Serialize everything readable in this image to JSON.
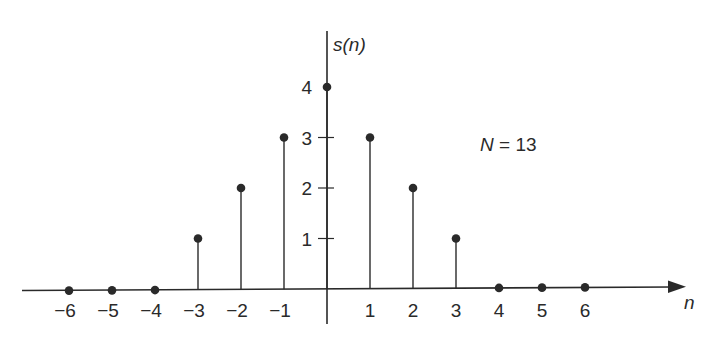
{
  "chart_data": {
    "type": "stem",
    "title": "",
    "xlabel": "n",
    "ylabel": "s(n)",
    "x": [
      -6,
      -5,
      -4,
      -3,
      -2,
      -1,
      0,
      1,
      2,
      3,
      4,
      5,
      6
    ],
    "values": [
      0,
      0,
      0,
      1,
      2,
      3,
      4,
      3,
      2,
      1,
      0,
      0,
      0
    ],
    "x_tick_labels": [
      "−6",
      "−5",
      "−4",
      "−3",
      "−2",
      "−1",
      "1",
      "2",
      "3",
      "4",
      "5",
      "6"
    ],
    "y_ticks": [
      1,
      2,
      3,
      4
    ],
    "y_tick_labels": [
      "1",
      "2",
      "3",
      "4"
    ],
    "xlim": [
      -6.5,
      8.5
    ],
    "ylim": [
      0,
      5.1
    ],
    "grid": false,
    "legend": null,
    "annotations": [
      {
        "text_var": "N",
        "text_rest": " = 13",
        "n": 3.5,
        "s": 3.1
      }
    ]
  },
  "style": {
    "ink_color": "#2a2a2a",
    "background": "#ffffff"
  }
}
